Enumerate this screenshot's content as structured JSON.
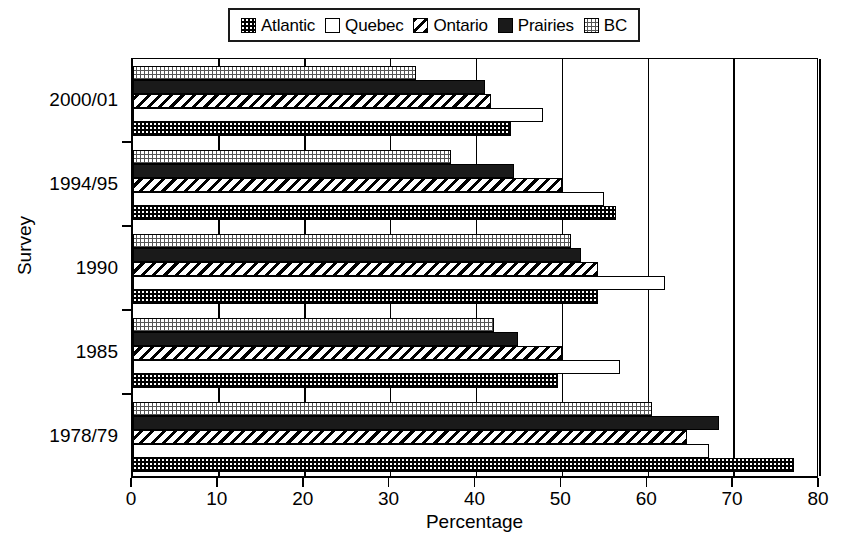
{
  "chart_data": {
    "type": "bar",
    "orientation": "horizontal",
    "title": "",
    "xlabel": "Percentage",
    "ylabel": "Survey",
    "xlim": [
      0,
      80
    ],
    "xticks": [
      0,
      10,
      20,
      30,
      40,
      50,
      60,
      70,
      80
    ],
    "grid": true,
    "grid_axis": "x",
    "legend_position": "top-center",
    "categories": [
      "1978/79",
      "1985",
      "1990",
      "1994/95",
      "2000/01"
    ],
    "series": [
      {
        "name": "Atlantic",
        "pattern": "checkerboard-dark",
        "values": [
          77.0,
          49.5,
          54.2,
          56.3,
          44.0
        ]
      },
      {
        "name": "Quebec",
        "pattern": "solid-white",
        "values": [
          67.1,
          56.7,
          62.0,
          54.8,
          47.8
        ]
      },
      {
        "name": "Ontario",
        "pattern": "diagonal-hatch",
        "values": [
          64.5,
          50.0,
          54.2,
          50.0,
          41.7
        ]
      },
      {
        "name": "Prairies",
        "pattern": "solid-black",
        "values": [
          68.2,
          44.8,
          52.2,
          44.4,
          41.0
        ]
      },
      {
        "name": "BC",
        "pattern": "checkerboard-light",
        "values": [
          60.4,
          42.0,
          51.0,
          37.0,
          33.0
        ]
      }
    ]
  },
  "legend": {
    "items": [
      {
        "label": "Atlantic",
        "swatch": "atlantic-swatch-icon"
      },
      {
        "label": "Quebec",
        "swatch": "quebec-swatch-icon"
      },
      {
        "label": "Ontario",
        "swatch": "ontario-swatch-icon"
      },
      {
        "label": "Prairies",
        "swatch": "prairies-swatch-icon"
      },
      {
        "label": "BC",
        "swatch": "bc-swatch-icon"
      }
    ]
  },
  "axes": {
    "x": {
      "label": "Percentage",
      "ticks": [
        "0",
        "10",
        "20",
        "30",
        "40",
        "50",
        "60",
        "70",
        "80"
      ]
    },
    "y": {
      "label": "Survey",
      "ticks": [
        "2000/01",
        "1994/95",
        "1990",
        "1985",
        "1978/79"
      ]
    }
  }
}
